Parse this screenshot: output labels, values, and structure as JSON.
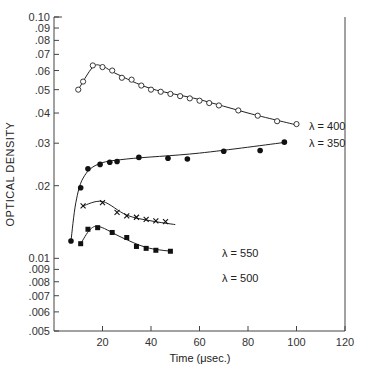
{
  "chart_data": {
    "type": "scatter",
    "title": "",
    "xlabel": "Time (μsec.)",
    "ylabel": "OPTICAL DENSITY",
    "xlim": [
      0,
      120
    ],
    "ylim": [
      0.005,
      0.1
    ],
    "yscale": "log",
    "grid": false,
    "x_ticks": [
      "20",
      "40",
      "60",
      "80",
      "100",
      "120"
    ],
    "y_ticks": [
      "0.10",
      ".09",
      ".08",
      ".07",
      ".06",
      ".05",
      ".04",
      ".03",
      ".02",
      "0.01",
      ".009",
      ".008",
      ".007",
      ".006",
      ".005"
    ],
    "series": [
      {
        "name": "λ = 400",
        "marker": "open-circle",
        "x": [
          10,
          12,
          16,
          20,
          24,
          28,
          32,
          36,
          40,
          44,
          48,
          52,
          56,
          60,
          64,
          68,
          76,
          84,
          92,
          100
        ],
        "y": [
          0.05,
          0.054,
          0.063,
          0.062,
          0.06,
          0.056,
          0.055,
          0.052,
          0.05,
          0.049,
          0.048,
          0.047,
          0.046,
          0.045,
          0.044,
          0.043,
          0.041,
          0.039,
          0.037,
          0.036
        ]
      },
      {
        "name": "λ = 350",
        "marker": "filled-circle",
        "x": [
          7,
          11,
          14,
          19,
          23,
          26,
          35,
          47,
          55,
          70,
          85,
          95
        ],
        "y": [
          0.0118,
          0.0196,
          0.0235,
          0.0245,
          0.025,
          0.0252,
          0.0262,
          0.026,
          0.0258,
          0.0278,
          0.028,
          0.0303
        ]
      },
      {
        "name": "λ = 550",
        "marker": "x",
        "x": [
          12,
          20,
          26,
          30,
          34,
          38,
          42,
          46
        ],
        "y": [
          0.0165,
          0.017,
          0.0155,
          0.015,
          0.0148,
          0.0145,
          0.0143,
          0.0142
        ]
      },
      {
        "name": "λ = 500",
        "marker": "filled-square",
        "x": [
          11,
          14,
          18,
          24,
          30,
          34,
          38,
          42,
          48
        ],
        "y": [
          0.0115,
          0.0132,
          0.0134,
          0.0128,
          0.0122,
          0.0112,
          0.011,
          0.0108,
          0.0107
        ]
      }
    ],
    "annotations": [
      "λ = 400",
      "λ = 350",
      "λ = 550",
      "λ = 500"
    ]
  }
}
